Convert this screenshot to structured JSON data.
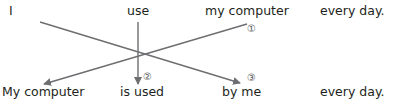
{
  "active_sentence": {
    "words": [
      "I",
      "use",
      "my computer",
      "every day."
    ]
  },
  "passive_sentence": {
    "words": [
      "My computer",
      "is used",
      "by me",
      "every day."
    ]
  },
  "step_markers": [
    "①",
    "②",
    "③"
  ],
  "arrows": [
    {
      "from": "my computer",
      "to": "My computer",
      "marker": "①"
    },
    {
      "from": "use",
      "to": "is used",
      "marker": "②"
    },
    {
      "from": "I",
      "to": "by me",
      "marker": "③"
    }
  ],
  "colors": {
    "line": "#6d6e71",
    "text": "#231f20"
  }
}
